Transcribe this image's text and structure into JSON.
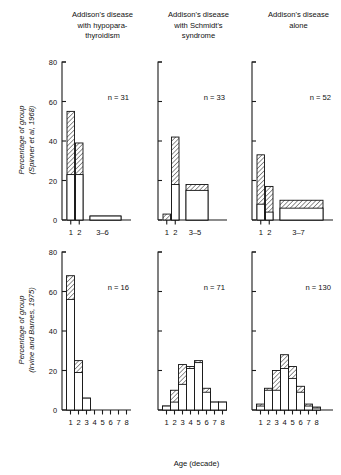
{
  "figure": {
    "xlabel": "Age (decade)",
    "ylabel_top": "Percentage of group\n(Spinner et al, 1968)",
    "ylabel_top_line1": "Percentage of group",
    "ylabel_top_line2": "(Spinner et al, 1968)",
    "ylabel_bottom_line1": "Percentage of group",
    "ylabel_bottom_line2": "(Irvine and Barnes, 1975)",
    "column_titles": [
      {
        "lines": [
          "Addison's disease",
          "with hypopara-",
          "thyroidism"
        ]
      },
      {
        "lines": [
          "Addison's disease",
          "with Schmidt's",
          "syndrome"
        ]
      },
      {
        "lines": [
          "Addison's disease",
          "alone"
        ]
      }
    ],
    "yticks": [
      0,
      20,
      40,
      60,
      80
    ]
  },
  "chart_data": [
    {
      "type": "bar",
      "panel": "top-left",
      "title": "Addison's disease with hypoparathyroidism",
      "source": "Spinner et al, 1968",
      "n_label": "n = 31",
      "n": 31,
      "xlabel": "",
      "ylabel": "Percentage of group (Spinner et al, 1968)",
      "ylim": [
        0,
        80
      ],
      "categories": [
        "1",
        "2",
        "3–6"
      ],
      "series": [
        {
          "name": "white (lower)",
          "values": [
            23,
            23,
            2
          ]
        },
        {
          "name": "hatched (upper)",
          "values": [
            55,
            39,
            2
          ]
        }
      ],
      "bar_widths": [
        "narrow",
        "narrow",
        "wide"
      ]
    },
    {
      "type": "bar",
      "panel": "top-middle",
      "title": "Addison's disease with Schmidt's syndrome",
      "source": "Spinner et al, 1968",
      "n_label": "n = 33",
      "n": 33,
      "xlabel": "",
      "ylabel": "Percentage of group (Spinner et al, 1968)",
      "ylim": [
        0,
        80
      ],
      "categories": [
        "1",
        "2",
        "3–5"
      ],
      "series": [
        {
          "name": "white (lower)",
          "values": [
            0,
            18,
            15
          ]
        },
        {
          "name": "hatched (upper)",
          "values": [
            3,
            42,
            18
          ]
        }
      ],
      "bar_widths": [
        "narrow",
        "narrow",
        "wide"
      ]
    },
    {
      "type": "bar",
      "panel": "top-right",
      "title": "Addison's disease alone",
      "source": "Spinner et al, 1968",
      "n_label": "n = 52",
      "n": 52,
      "xlabel": "",
      "ylabel": "Percentage of group (Spinner et al, 1968)",
      "ylim": [
        0,
        80
      ],
      "categories": [
        "1",
        "2",
        "3–7"
      ],
      "series": [
        {
          "name": "white (lower)",
          "values": [
            8,
            4,
            6
          ]
        },
        {
          "name": "hatched (upper)",
          "values": [
            33,
            17,
            10
          ]
        }
      ],
      "bar_widths": [
        "narrow",
        "narrow",
        "wide"
      ]
    },
    {
      "type": "bar",
      "panel": "bottom-left",
      "title": "Addison's disease with hypoparathyroidism",
      "source": "Irvine and Barnes, 1975",
      "n_label": "n = 16",
      "n": 16,
      "xlabel": "Age (decade)",
      "ylabel": "Percentage of group (Irvine and Barnes, 1975)",
      "ylim": [
        0,
        80
      ],
      "categories": [
        "1",
        "2",
        "3",
        "4",
        "5",
        "6",
        "7",
        "8"
      ],
      "series": [
        {
          "name": "white (lower)",
          "values": [
            56,
            19,
            6,
            0,
            0,
            0,
            0,
            0
          ]
        },
        {
          "name": "hatched (upper)",
          "values": [
            68,
            25,
            6,
            0,
            0,
            0,
            0,
            0
          ]
        }
      ]
    },
    {
      "type": "bar",
      "panel": "bottom-middle",
      "title": "Addison's disease with Schmidt's syndrome",
      "source": "Irvine and Barnes, 1975",
      "n_label": "n = 71",
      "n": 71,
      "xlabel": "Age (decade)",
      "ylabel": "Percentage of group (Irvine and Barnes, 1975)",
      "ylim": [
        0,
        80
      ],
      "categories": [
        "1",
        "2",
        "3",
        "4",
        "5",
        "6",
        "7",
        "8"
      ],
      "series": [
        {
          "name": "white (lower)",
          "values": [
            2,
            4,
            13,
            21,
            24,
            9,
            4,
            4
          ]
        },
        {
          "name": "hatched (upper)",
          "values": [
            2,
            10,
            23,
            22,
            25,
            11,
            4,
            4
          ]
        }
      ]
    },
    {
      "type": "bar",
      "panel": "bottom-right",
      "title": "Addison's disease alone",
      "source": "Irvine and Barnes, 1975",
      "n_label": "n = 130",
      "n": 130,
      "xlabel": "Age (decade)",
      "ylabel": "Percentage of group (Irvine and Barnes, 1975)",
      "ylim": [
        0,
        80
      ],
      "categories": [
        "1",
        "2",
        "3",
        "4",
        "5",
        "6",
        "7",
        "8"
      ],
      "series": [
        {
          "name": "white (lower)",
          "values": [
            2,
            10,
            10,
            21,
            16,
            9,
            2,
            1
          ]
        },
        {
          "name": "hatched (upper)",
          "values": [
            3,
            11,
            20,
            28,
            22,
            12,
            3,
            1.5
          ]
        }
      ]
    }
  ]
}
